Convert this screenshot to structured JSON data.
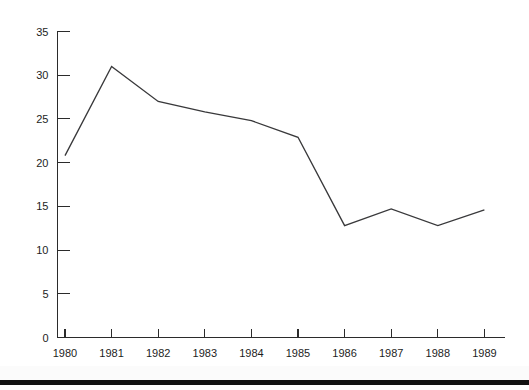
{
  "chart_data": {
    "type": "line",
    "title": "",
    "xlabel": "",
    "ylabel": "",
    "categories": [
      "1980",
      "1981",
      "1982",
      "1983",
      "1984",
      "1985",
      "1986",
      "1987",
      "1988",
      "1989"
    ],
    "x": [
      1980,
      1981,
      1982,
      1983,
      1984,
      1985,
      1986,
      1987,
      1988,
      1989
    ],
    "values": [
      20.8,
      31.0,
      27.0,
      25.8,
      24.8,
      22.9,
      12.8,
      14.7,
      12.8,
      14.6
    ],
    "series": [
      {
        "name": "series-1",
        "values": [
          20.8,
          31.0,
          27.0,
          25.8,
          24.8,
          22.9,
          12.8,
          14.7,
          12.8,
          14.6
        ]
      }
    ],
    "ylim": [
      0,
      35
    ],
    "yticks": [
      0,
      5,
      10,
      15,
      20,
      25,
      30,
      35
    ],
    "ytick_labels": [
      "0",
      "5",
      "10",
      "15",
      "20",
      "25",
      "30",
      "35"
    ],
    "xtick_labels": [
      "1980",
      "1981",
      "1982",
      "1983",
      "1984",
      "1985",
      "1986",
      "1987",
      "1988",
      "1989"
    ],
    "grid": false,
    "legend": false,
    "legend_position": "none",
    "line_color": "#39393b",
    "axis_color": "#2b2b2b",
    "background_color": "#ffffff",
    "annotations": []
  },
  "figure": {
    "scan_bar_color": "#121212"
  }
}
